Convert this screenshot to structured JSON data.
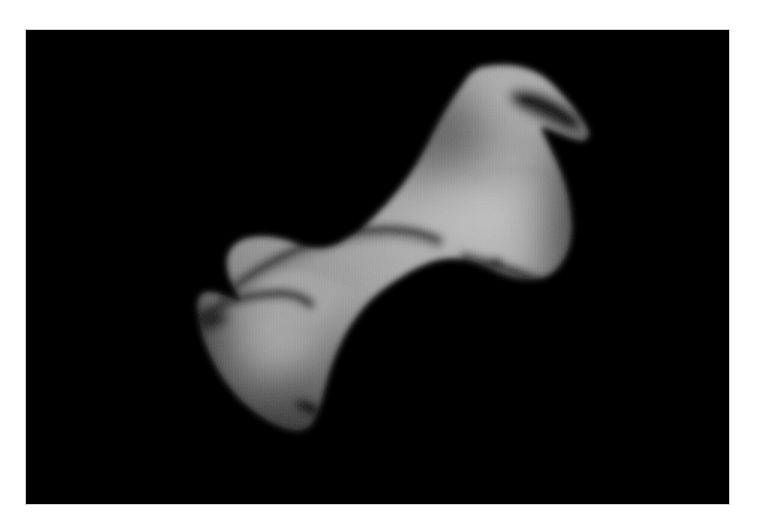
{
  "figure": {
    "kind": "grayscale-shape-model-render",
    "subject_label": "dog-bone shaped asteroid shape model",
    "caption": "",
    "title": "",
    "axis_labels": [],
    "tick_labels": [],
    "legend": [],
    "annotations": [],
    "visible_text": []
  },
  "canvas": {
    "width_px": 758,
    "height_px": 528,
    "page_background": "#ffffff"
  },
  "image_panel": {
    "left_px": 26,
    "top_px": 30,
    "width_px": 703,
    "height_px": 474,
    "background": "#000000",
    "border_color": "#cfcfcf"
  },
  "palette": {
    "sky_black": "#000000",
    "terminator_dark": "#121212",
    "shadow_crease": "#2a2a2a",
    "limb_dim": "#5a5a5a",
    "surface_mid": "#9a9a9a",
    "surface_light": "#b4b4b4",
    "surface_bright": "#c6c6c6",
    "specular_peak": "#d2d2d2"
  },
  "object": {
    "name": "asteroid",
    "morphology": "bilobed dumbbell / dog-bone",
    "long_axis_orientation_deg": -40,
    "lobes": [
      {
        "id": "upper-right-lobe",
        "role": "larger lobe",
        "center_px": [
          480,
          160
        ],
        "approx_width_px": 185,
        "approx_height_px": 190,
        "brightness": "#b8b8b8"
      },
      {
        "id": "lower-left-lobe",
        "role": "smaller lobe",
        "center_px": [
          272,
          345
        ],
        "approx_width_px": 210,
        "approx_height_px": 165,
        "brightness": "#c0c0c0"
      }
    ],
    "neck": {
      "id": "waist",
      "center_px": [
        372,
        268
      ],
      "approx_thickness_px": 78,
      "brightness": "#a8a8a8"
    },
    "features": [
      {
        "id": "top-right-notch-shadow",
        "type": "dark notch / concavity",
        "center_px": [
          512,
          88
        ],
        "brightness": "#1d1d1d"
      },
      {
        "id": "upper-neck-shadow-ridge",
        "type": "curved shadow ridge",
        "from_px": [
          298,
          228
        ],
        "to_px": [
          430,
          258
        ],
        "brightness": "#2e2e2e"
      },
      {
        "id": "right-flank-crease",
        "type": "crease shadow",
        "center_px": [
          505,
          252
        ],
        "brightness": "#3a3a3a"
      },
      {
        "id": "left-shoulder-ridge",
        "type": "shadow ridge",
        "from_px": [
          175,
          296
        ],
        "to_px": [
          262,
          276
        ],
        "brightness": "#333333"
      },
      {
        "id": "lower-right-crease",
        "type": "dark crease along limb",
        "from_px": [
          300,
          400
        ],
        "to_px": [
          372,
          424
        ],
        "brightness": "#232323"
      },
      {
        "id": "mid-lobe-terminator",
        "type": "soft terminator gradient",
        "center_px": [
          330,
          330
        ],
        "brightness": "#8e8e8e"
      }
    ]
  }
}
